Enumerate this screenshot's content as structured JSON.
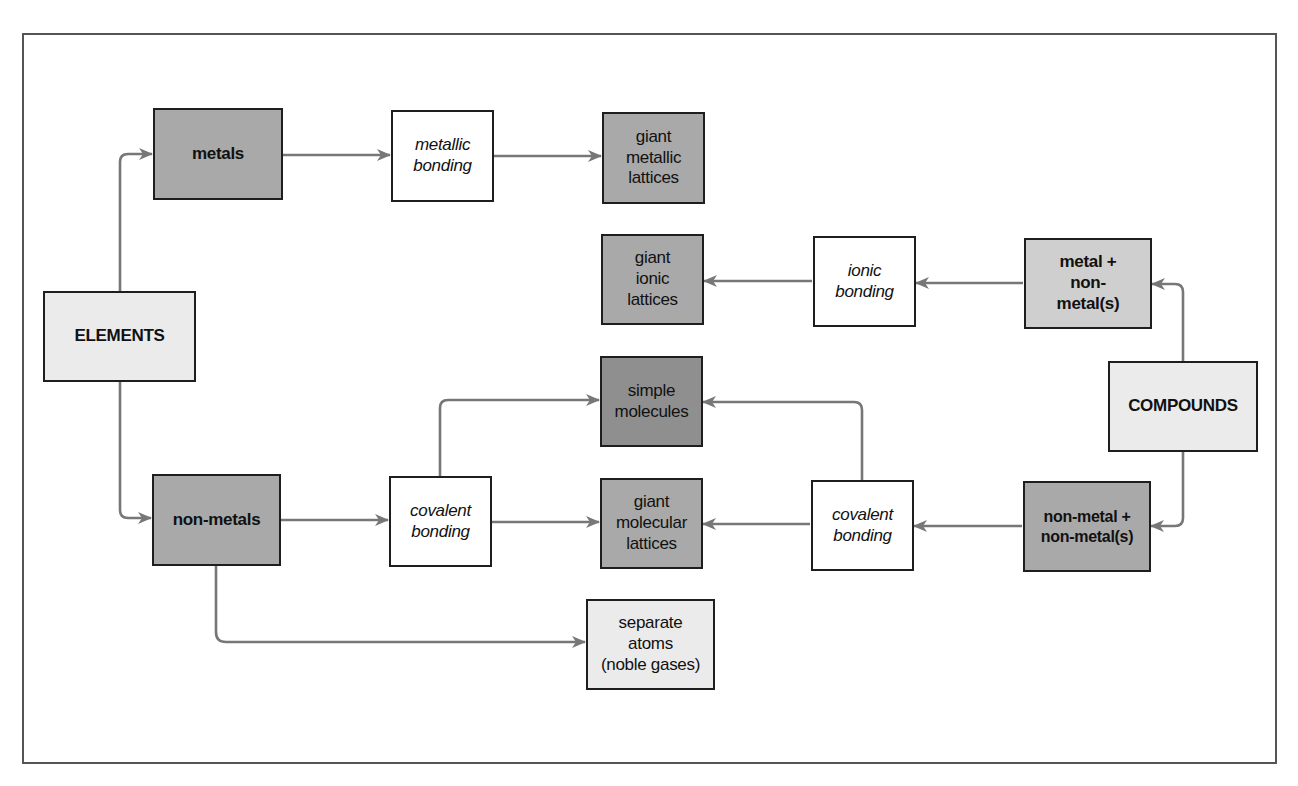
{
  "diagram": {
    "colors": {
      "frame": "#555555",
      "box_border": "#1e1e1e",
      "arrow": "#777777",
      "fill_white": "#ffffff",
      "fill_light": "#ebebeb",
      "fill_lightmid": "#cfcfcf",
      "fill_mid": "#a9a9a9",
      "fill_dark": "#8f8f8f"
    },
    "nodes": {
      "elements": {
        "label": "ELEMENTS",
        "style": "bold",
        "fill": "light"
      },
      "metals": {
        "label": "metals",
        "style": "bold",
        "fill": "mid"
      },
      "non_metals": {
        "label": "non-metals",
        "style": "bold",
        "fill": "mid"
      },
      "metallic_bonding": {
        "label": "metallic\nbonding",
        "style": "italic",
        "fill": "white"
      },
      "covalent_bonding_left": {
        "label": "covalent\nbonding",
        "style": "italic",
        "fill": "white"
      },
      "giant_metallic_lattices": {
        "label": "giant\nmetallic\nlattices",
        "style": "regular",
        "fill": "mid"
      },
      "giant_ionic_lattices": {
        "label": "giant\nionic\nlattices",
        "style": "regular",
        "fill": "mid"
      },
      "simple_molecules": {
        "label": "simple\nmolecules",
        "style": "regular",
        "fill": "dark"
      },
      "giant_molecular_lattices": {
        "label": "giant\nmolecular\nlattices",
        "style": "regular",
        "fill": "mid"
      },
      "separate_atoms": {
        "label": "separate\natoms\n(noble gases)",
        "style": "regular",
        "fill": "light"
      },
      "ionic_bonding": {
        "label": "ionic\nbonding",
        "style": "italic",
        "fill": "white"
      },
      "covalent_bonding_right": {
        "label": "covalent\nbonding",
        "style": "italic",
        "fill": "white"
      },
      "metal_non_metals": {
        "label": "metal +\nnon-\nmetal(s)",
        "style": "bold",
        "fill": "lightmid"
      },
      "non_metal_non_metals": {
        "label": "non-metal +\nnon-metal(s)",
        "style": "bold",
        "fill": "mid"
      },
      "compounds": {
        "label": "COMPOUNDS",
        "style": "bold",
        "fill": "light"
      }
    },
    "edges": [
      {
        "from": "elements",
        "to": "metals"
      },
      {
        "from": "elements",
        "to": "non_metals"
      },
      {
        "from": "metals",
        "to": "metallic_bonding"
      },
      {
        "from": "metallic_bonding",
        "to": "giant_metallic_lattices"
      },
      {
        "from": "non_metals",
        "to": "covalent_bonding_left"
      },
      {
        "from": "non_metals",
        "to": "separate_atoms"
      },
      {
        "from": "covalent_bonding_left",
        "to": "simple_molecules"
      },
      {
        "from": "covalent_bonding_left",
        "to": "giant_molecular_lattices"
      },
      {
        "from": "compounds",
        "to": "metal_non_metals"
      },
      {
        "from": "compounds",
        "to": "non_metal_non_metals"
      },
      {
        "from": "metal_non_metals",
        "to": "ionic_bonding"
      },
      {
        "from": "ionic_bonding",
        "to": "giant_ionic_lattices"
      },
      {
        "from": "non_metal_non_metals",
        "to": "covalent_bonding_right"
      },
      {
        "from": "covalent_bonding_right",
        "to": "giant_molecular_lattices"
      },
      {
        "from": "covalent_bonding_right",
        "to": "simple_molecules"
      }
    ]
  }
}
